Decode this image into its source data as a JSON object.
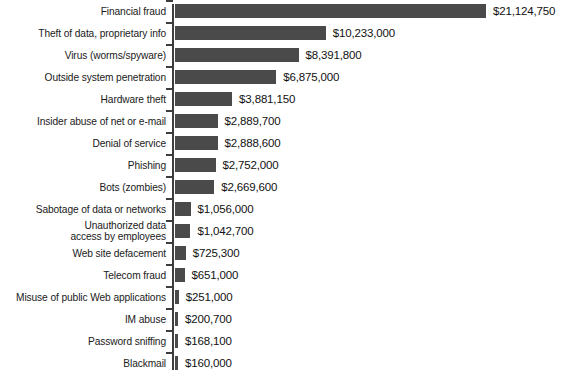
{
  "chart_data": {
    "type": "bar",
    "orientation": "horizontal",
    "title": "",
    "subtitle": "",
    "xlabel": "",
    "ylabel": "",
    "grid": false,
    "legend": null,
    "axis_line": true,
    "value_prefix": "$",
    "xlim": [
      0,
      21124750
    ],
    "categories": [
      "Financial fraud",
      "Theft of data, proprietary info",
      "Virus (worms/spyware)",
      "Outside system penetration",
      "Hardware theft",
      "Insider abuse of net or e-mail",
      "Denial of service",
      "Phishing",
      "Bots (zombies)",
      "Sabotage of data or networks",
      "Unauthorized data\naccess by employees",
      "Web site defacement",
      "Telecom fraud",
      "Misuse of public Web applications",
      "IM abuse",
      "Password sniffing",
      "Blackmail"
    ],
    "values": [
      21124750,
      10233000,
      8391800,
      6875000,
      3881150,
      2889700,
      2888600,
      2752000,
      2669600,
      1056000,
      1042700,
      725300,
      651000,
      251000,
      200700,
      168100,
      160000
    ],
    "value_labels": [
      "$21,124,750",
      "$10,233,000",
      "$8,391,800",
      "$6,875,000",
      "$3,881,150",
      "$2,889,700",
      "$2,888,600",
      "$2,752,000",
      "$2,669,600",
      "$1,056,000",
      "$1,042,700",
      "$725,300",
      "$651,000",
      "$251,000",
      "$200,700",
      "$168,100",
      "$160,000"
    ],
    "colors": {
      "bar": "#4a4a4a",
      "axis": "#3d3d3d",
      "text": "#1a1a1a",
      "background": "#ffffff"
    }
  }
}
